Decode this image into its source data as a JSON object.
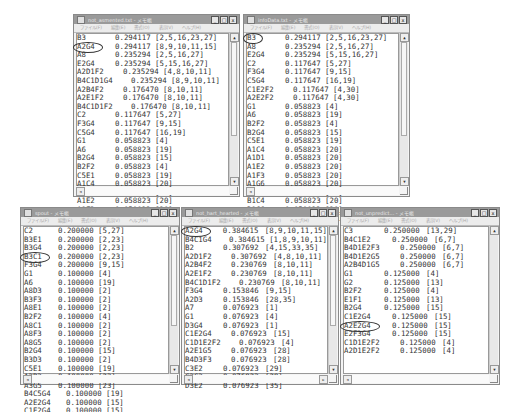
{
  "app": {
    "name": "メモ帳"
  },
  "menu": [
    "ファイル(F)",
    "編集(E)",
    "書式(O)",
    "表示(V)",
    "ヘルプ(H)"
  ],
  "window_controls": {
    "minimize": "_",
    "maximize": "□",
    "close": "x"
  },
  "windows": [
    {
      "id": "win1",
      "title": "not_asmented.txt - メモ帳",
      "circled_row": 1,
      "rows": [
        {
          "key": "B3",
          "value": "0.294117",
          "set": "[2,5,16,23,27]"
        },
        {
          "key": "A2G4",
          "value": "0.294117",
          "set": "[8,9,10,11,15]"
        },
        {
          "key": "A8",
          "value": "0.235294",
          "set": "[2,5,16,27]"
        },
        {
          "key": "E2G4",
          "value": "0.235294",
          "set": "[5,15,16,27]"
        },
        {
          "key": "A2D1F2",
          "value": "0.235294",
          "set": "[4,8,10,11]"
        },
        {
          "key": "B4C1D1G4",
          "value": "0.235294",
          "set": "[8,9,10,11]"
        },
        {
          "key": "A2B4F2",
          "value": "0.176470",
          "set": "[8,10,11]"
        },
        {
          "key": "A2E1F2",
          "value": "0.176470",
          "set": "[8,10,11]"
        },
        {
          "key": "B4C1D1F2",
          "value": "0.176470",
          "set": "[8,10,11]"
        },
        {
          "key": "C2",
          "value": "0.117647",
          "set": "[5,27]"
        },
        {
          "key": "F3G4",
          "value": "0.117647",
          "set": "[9,15]"
        },
        {
          "key": "C5G4",
          "value": "0.117647",
          "set": "[16,19]"
        },
        {
          "key": "G1",
          "value": "0.058823",
          "set": "[4]"
        },
        {
          "key": "A6",
          "value": "0.058823",
          "set": "[19]"
        },
        {
          "key": "B2G4",
          "value": "0.058823",
          "set": "[15]"
        },
        {
          "key": "B2F2",
          "value": "0.058823",
          "set": "[4]"
        },
        {
          "key": "C5E1",
          "value": "0.058823",
          "set": "[19]"
        },
        {
          "key": "A1C4",
          "value": "0.058823",
          "set": "[20]"
        },
        {
          "key": "A1D1",
          "value": "0.058823",
          "set": "[20]"
        },
        {
          "key": "A1E2",
          "value": "0.058823",
          "set": "[20]"
        },
        {
          "key": "A1F3",
          "value": "0.058823",
          "set": "[20]"
        },
        {
          "key": "A1G6",
          "value": "0.058823",
          "set": "[20]"
        }
      ]
    },
    {
      "id": "win2",
      "title": "infoData.txt - メモ帳",
      "circled_row": 0,
      "rows": [
        {
          "key": "B3",
          "value": "0.294117",
          "set": "[2,5,16,23,27]"
        },
        {
          "key": "A8",
          "value": "0.235294",
          "set": "[2,5,16,27]"
        },
        {
          "key": "E2G4",
          "value": "0.235294",
          "set": "[5,15,16,27]"
        },
        {
          "key": "C2",
          "value": "0.117647",
          "set": "[5,27]"
        },
        {
          "key": "F3G4",
          "value": "0.117647",
          "set": "[9,15]"
        },
        {
          "key": "C5G4",
          "value": "0.117647",
          "set": "[16,19]"
        },
        {
          "key": "C1E2F2",
          "value": "0.117647",
          "set": "[4,30]"
        },
        {
          "key": "A2E2F2",
          "value": "0.117647",
          "set": "[4,30]"
        },
        {
          "key": "G1",
          "value": "0.058823",
          "set": "[4]"
        },
        {
          "key": "A6",
          "value": "0.058823",
          "set": "[19]"
        },
        {
          "key": "B2F2",
          "value": "0.058823",
          "set": "[4]"
        },
        {
          "key": "B2G4",
          "value": "0.058823",
          "set": "[15]"
        },
        {
          "key": "C5E1",
          "value": "0.058823",
          "set": "[19]"
        },
        {
          "key": "A1C4",
          "value": "0.058823",
          "set": "[20]"
        },
        {
          "key": "A1D1",
          "value": "0.058823",
          "set": "[20]"
        },
        {
          "key": "A1E2",
          "value": "0.058823",
          "set": "[20]"
        },
        {
          "key": "A1F3",
          "value": "0.058823",
          "set": "[20]"
        },
        {
          "key": "A1G6",
          "value": "0.058823",
          "set": "[20]"
        },
        {
          "key": "A1B1",
          "value": "0.058823",
          "set": "[20]"
        },
        {
          "key": "B1C4",
          "value": "0.058823",
          "set": "[20]"
        },
        {
          "key": "B1G6",
          "value": "0.058823",
          "set": "[20]"
        },
        {
          "key": "C4G6",
          "value": "0.058823",
          "set": "[20]"
        }
      ]
    },
    {
      "id": "win3",
      "title": "spout - メモ帳",
      "circled_row": 3,
      "rows": [
        {
          "key": "C2",
          "value": "0.200000",
          "set": "[5,27]"
        },
        {
          "key": "B3E1",
          "value": "0.200000",
          "set": "[2,23]"
        },
        {
          "key": "B3G4",
          "value": "0.200000",
          "set": "[2,23]"
        },
        {
          "key": "B3C1",
          "value": "0.200000",
          "set": "[2,23]"
        },
        {
          "key": "F3G4",
          "value": "0.200000",
          "set": "[9,15]"
        },
        {
          "key": "G1",
          "value": "0.100000",
          "set": "[4]"
        },
        {
          "key": "A6",
          "value": "0.100000",
          "set": "[19]"
        },
        {
          "key": "A8D3",
          "value": "0.100000",
          "set": "[2]"
        },
        {
          "key": "B3F3",
          "value": "0.100000",
          "set": "[2]"
        },
        {
          "key": "A8E1",
          "value": "0.100000",
          "set": "[2]"
        },
        {
          "key": "B2F2",
          "value": "0.100000",
          "set": "[4]"
        },
        {
          "key": "A8C1",
          "value": "0.100000",
          "set": "[2]"
        },
        {
          "key": "A8F3",
          "value": "0.100000",
          "set": "[2]"
        },
        {
          "key": "A8G5",
          "value": "0.100000",
          "set": "[2]"
        },
        {
          "key": "B2G4",
          "value": "0.100000",
          "set": "[15]"
        },
        {
          "key": "B3D3",
          "value": "0.100000",
          "set": "[2]"
        },
        {
          "key": "C5E1",
          "value": "0.100000",
          "set": "[19]"
        },
        {
          "key": "A3B3",
          "value": "0.100000",
          "set": "[23]"
        },
        {
          "key": "A3G5",
          "value": "0.100000",
          "set": "[23]"
        },
        {
          "key": "B4C5G4",
          "value": "0.100000",
          "set": "[19]"
        },
        {
          "key": "A2E2G4",
          "value": "0.100000",
          "set": "[15]"
        },
        {
          "key": "C1E2G4",
          "value": "0.100000",
          "set": "[15]"
        }
      ]
    },
    {
      "id": "win4",
      "title": "not_hart_hearted - メモ帳",
      "circled_row": 0,
      "rows": [
        {
          "key": "A2G4",
          "value": "0.384615",
          "set": "[8,9,10,11,15]"
        },
        {
          "key": "B4C1G4",
          "value": "0.384615",
          "set": "[1,8,9,10,11]"
        },
        {
          "key": "B2",
          "value": "0.307692",
          "set": "[4,15,33,35]"
        },
        {
          "key": "A2D1F2",
          "value": "0.307692",
          "set": "[4,8,10,11]"
        },
        {
          "key": "A2B4F2",
          "value": "0.230769",
          "set": "[8,10,11]"
        },
        {
          "key": "A2E1F2",
          "value": "0.230769",
          "set": "[8,10,11]"
        },
        {
          "key": "B4C1D1F2",
          "value": "0.230769",
          "set": "[8,10,11]"
        },
        {
          "key": "F3G4",
          "value": "0.153846",
          "set": "[9,15]"
        },
        {
          "key": "A2D3",
          "value": "0.153846",
          "set": "[28,35]"
        },
        {
          "key": "A7",
          "value": "0.076923",
          "set": "[1]"
        },
        {
          "key": "G1",
          "value": "0.076923",
          "set": "[4]"
        },
        {
          "key": "D3G4",
          "value": "0.076923",
          "set": "[1]"
        },
        {
          "key": "C1E2G4",
          "value": "0.076923",
          "set": "[15]"
        },
        {
          "key": "C1D1E2F2",
          "value": "0.076923",
          "set": "[4]"
        },
        {
          "key": "A2E1G5",
          "value": "0.076923",
          "set": "[28]"
        },
        {
          "key": "B4D3F3",
          "value": "0.076923",
          "set": "[28]"
        },
        {
          "key": "C3E2",
          "value": "0.076923",
          "set": "[29]"
        },
        {
          "key": "C3G3",
          "value": "0.076923",
          "set": "[29]"
        },
        {
          "key": "D3E2",
          "value": "0.076923",
          "set": "[35]"
        }
      ]
    },
    {
      "id": "win5",
      "title": "not_unpredict... - メモ帳",
      "circled_row": 11,
      "rows": [
        {
          "key": "C3",
          "value": "0.250000",
          "set": "[13,29]"
        },
        {
          "key": "B4C1E2",
          "value": "0.250000",
          "set": "[6,7]"
        },
        {
          "key": "B4D1E2F3",
          "value": "0.250000",
          "set": "[6,7]"
        },
        {
          "key": "B4D1E2G5",
          "value": "0.250000",
          "set": "[6,7]"
        },
        {
          "key": "A2B4D1G5",
          "value": "0.250000",
          "set": "[6,7]"
        },
        {
          "key": "G1",
          "value": "0.125000",
          "set": "[4]"
        },
        {
          "key": "G2",
          "value": "0.125000",
          "set": "[13]"
        },
        {
          "key": "B2F2",
          "value": "0.125000",
          "set": "[4]"
        },
        {
          "key": "E1F1",
          "value": "0.125000",
          "set": "[13]"
        },
        {
          "key": "B2G4",
          "value": "0.125000",
          "set": "[15]"
        },
        {
          "key": "C1E2G4",
          "value": "0.125000",
          "set": "[15]"
        },
        {
          "key": "A2E2G4",
          "value": "0.125000",
          "set": "[15]"
        },
        {
          "key": "E2F3G4",
          "value": "0.125000",
          "set": "[15]"
        },
        {
          "key": "C1D1E2F2",
          "value": "0.125000",
          "set": "[4]"
        },
        {
          "key": "A2D1E2F2",
          "value": "0.125000",
          "set": "[4]"
        }
      ]
    }
  ]
}
